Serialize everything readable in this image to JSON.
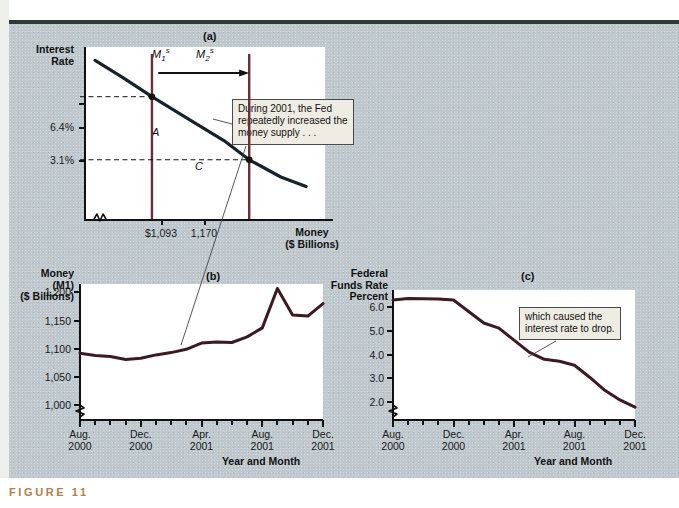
{
  "figure": {
    "caption": "FIGURE 11",
    "panel_a_letter": "(a)",
    "panel_b_letter": "(b)",
    "panel_c_letter": "(c)"
  },
  "colors": {
    "money_line": "#3d1a22",
    "demand_curve": "#16232b",
    "supply_line": "#6b2franch",
    "background": "#bfc8cd",
    "plot_bg": "#ffffff",
    "caption": "#b08050",
    "callout_bg": "#efece3"
  },
  "panel_a": {
    "letter": "(a)",
    "ylabel_line1": "Interest",
    "ylabel_line2": "Rate",
    "xlabel_line1": "Money",
    "xlabel_line2": "($ Billions)",
    "ytick_labels": [
      "6.4%",
      "3.1%"
    ],
    "ytick_values": [
      6.4,
      3.1
    ],
    "xtick_labels": [
      "$1,093",
      "1,170"
    ],
    "xtick_values": [
      1093,
      1170
    ],
    "supply_labels": [
      "M",
      "M"
    ],
    "supply_label_1": "M",
    "supply_label_1_sub": "1",
    "supply_label_1_sup": "s",
    "supply_label_2": "M",
    "supply_label_2_sub": "2",
    "supply_label_2_sup": "s",
    "point_a": "A",
    "point_c": "C",
    "callout": "During 2001, the Fed repeatedly increased the money supply . . .",
    "callout_line1": "During 2001, the Fed",
    "callout_line2": "repeatedly increased the",
    "callout_line3": "money supply . . ."
  },
  "panel_c_callout": {
    "line1": "which caused the",
    "line2": "interest rate to drop."
  },
  "chart_data": [
    {
      "type": "line",
      "id": "panel-a-money-market",
      "title": "(a)",
      "xlabel": "Money ($ Billions)",
      "ylabel": "Interest Rate",
      "xlim": [
        1040,
        1230
      ],
      "ylim": [
        0,
        9
      ],
      "grid": false,
      "legend": "none",
      "annotations": [
        "During 2001, the Fed repeatedly increased the money supply . . ."
      ],
      "xtick_labels": [
        "$1,093",
        "1,170"
      ],
      "ytick_labels": [
        "6.4%",
        "3.1%"
      ],
      "series": [
        {
          "name": "Money demand",
          "kind": "curve",
          "x": [
            1048,
            1070,
            1093,
            1120,
            1150,
            1170,
            1195,
            1215
          ],
          "y": [
            8.3,
            7.4,
            6.4,
            5.3,
            4.1,
            3.1,
            2.2,
            1.7
          ]
        },
        {
          "name": "M1s",
          "kind": "vertical-line",
          "x": 1093,
          "label": "M1s"
        },
        {
          "name": "M2s",
          "kind": "vertical-line",
          "x": 1170,
          "label": "M2s"
        }
      ],
      "points": [
        {
          "label": "A",
          "x": 1093,
          "y": 6.4
        },
        {
          "label": "C",
          "x": 1170,
          "y": 3.1
        }
      ]
    },
    {
      "type": "line",
      "id": "panel-b-money-m1",
      "title": "(b)",
      "ylabel": "Money (M1) ($ Billions)",
      "ylabel_line1": "Money",
      "ylabel_line2": "(M1)",
      "ylabel_line3": "($ Billions)",
      "xlabel": "Year and Month",
      "ylim": [
        975,
        1215
      ],
      "ytick_labels": [
        "1,000",
        "1,050",
        "1,100",
        "1,150",
        "1,200"
      ],
      "ytick_values": [
        1000,
        1050,
        1100,
        1150,
        1200
      ],
      "xtick_labels": [
        "Aug. 2000",
        "Dec. 2000",
        "Apr. 2001",
        "Aug. 2001",
        "Dec. 2001"
      ],
      "xtick_major": [
        "Aug.\n2000",
        "Dec.\n2000",
        "Apr.\n2001",
        "Aug.\n2001",
        "Dec.\n2001"
      ],
      "grid": false,
      "legend": "none",
      "categories": [
        "Aug. 2000",
        "Sep. 2000",
        "Oct. 2000",
        "Nov. 2000",
        "Dec. 2000",
        "Jan. 2001",
        "Feb. 2001",
        "Mar. 2001",
        "Apr. 2001",
        "May 2001",
        "Jun. 2001",
        "Jul. 2001",
        "Aug. 2001",
        "Sep. 2001",
        "Oct. 2001",
        "Nov. 2001",
        "Dec. 2001"
      ],
      "values": [
        1092,
        1088,
        1086,
        1081,
        1083,
        1089,
        1093,
        1099,
        1110,
        1112,
        1111,
        1121,
        1137,
        1207,
        1160,
        1158,
        1180
      ]
    },
    {
      "type": "line",
      "id": "panel-c-fed-funds-rate",
      "title": "(c)",
      "ylabel": "Federal Funds Rate Percent",
      "ylabel_line1": "Federal",
      "ylabel_line2": "Funds Rate",
      "ylabel_line3": "Percent",
      "xlabel": "Year and Month",
      "ylim": [
        1.3,
        6.7
      ],
      "ytick_labels": [
        "2.0",
        "3.0",
        "4.0",
        "5.0",
        "6.0"
      ],
      "ytick_values": [
        2.0,
        3.0,
        4.0,
        5.0,
        6.0
      ],
      "xtick_labels": [
        "Aug. 2000",
        "Dec. 2000",
        "Apr. 2001",
        "Aug. 2001",
        "Dec. 2001"
      ],
      "grid": false,
      "legend": "none",
      "annotations": [
        "which caused the interest rate to drop."
      ],
      "categories": [
        "Aug. 2000",
        "Sep. 2000",
        "Oct. 2000",
        "Nov. 2000",
        "Dec. 2000",
        "Jan. 2001",
        "Feb. 2001",
        "Mar. 2001",
        "Apr. 2001",
        "May 2001",
        "Jun. 2001",
        "Jul. 2001",
        "Aug. 2001",
        "Sep. 2001",
        "Oct. 2001",
        "Nov. 2001",
        "Dec. 2001"
      ],
      "values": [
        6.28,
        6.35,
        6.33,
        6.32,
        6.28,
        5.8,
        5.32,
        5.1,
        4.6,
        4.1,
        3.8,
        3.72,
        3.55,
        3.05,
        2.5,
        2.1,
        1.8
      ]
    }
  ]
}
